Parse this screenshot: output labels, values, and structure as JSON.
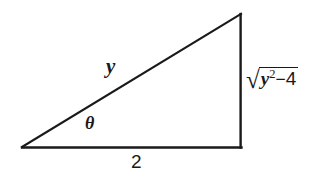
{
  "figure": {
    "kind": "right-triangle-trig-diagram",
    "background_color": "#ffffff",
    "stroke_color": "#1a1a1a",
    "width": 332,
    "height": 176,
    "vertices": {
      "left": {
        "x": 22,
        "y": 147
      },
      "bottom_right": {
        "x": 241,
        "y": 147
      },
      "top_right": {
        "x": 241,
        "y": 14
      }
    },
    "sides": {
      "hypotenuse": {
        "name": "hypotenuse",
        "label": "y"
      },
      "base": {
        "name": "adjacent-side",
        "label": "2"
      },
      "vertical": {
        "name": "opposite-side"
      }
    },
    "angle": {
      "name": "theta-angle",
      "label": "θ"
    },
    "opposite_label": {
      "radical_sign": "√",
      "variable": "y",
      "exponent": "2",
      "operator": "−",
      "constant": "4",
      "plain_text": "√(y²−4)"
    }
  }
}
